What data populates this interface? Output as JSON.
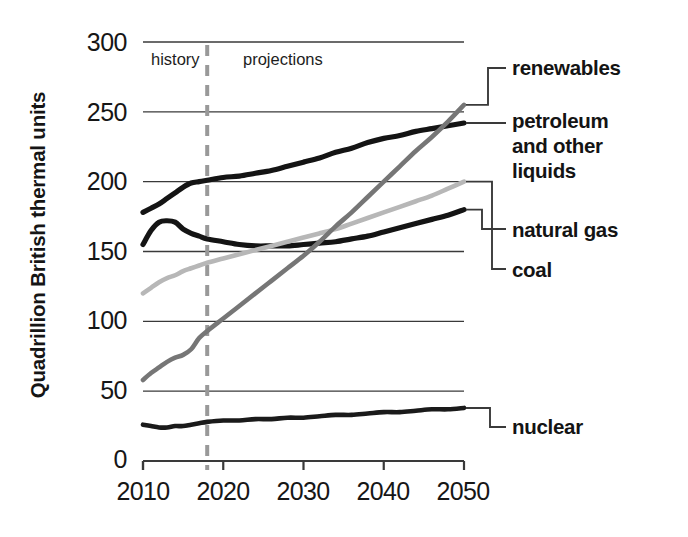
{
  "chart_data": {
    "type": "line",
    "title": "",
    "xlabel": "",
    "ylabel": "Quadrillion British thermal units",
    "xlim": [
      2010,
      2050
    ],
    "ylim": [
      0,
      300
    ],
    "ytick_labels": [
      "300",
      "250",
      "200",
      "150",
      "100",
      "50",
      "0"
    ],
    "ytick_values": [
      300,
      250,
      200,
      150,
      100,
      50,
      0
    ],
    "xtick_labels": [
      "2010",
      "2020",
      "2030",
      "2040",
      "2050"
    ],
    "xtick_values": [
      2010,
      2020,
      2030,
      2040,
      2050
    ],
    "grid": true,
    "legend_position": "right-callouts",
    "annotations": [
      {
        "name": "history",
        "text": "history",
        "x": 2014
      },
      {
        "name": "projections",
        "text": "projections",
        "x": 2033
      },
      {
        "name": "divider",
        "text": "",
        "x": 2018,
        "style": "dashed"
      }
    ],
    "x": [
      2010,
      2011,
      2012,
      2013,
      2014,
      2015,
      2016,
      2017,
      2018,
      2020,
      2022,
      2024,
      2026,
      2028,
      2030,
      2032,
      2034,
      2036,
      2038,
      2040,
      2042,
      2044,
      2046,
      2048,
      2050
    ],
    "series": [
      {
        "name": "petroleum and other liquids",
        "color": "#141414",
        "values": [
          178,
          181,
          184,
          188,
          192,
          196,
          199,
          200,
          201,
          203,
          204,
          206,
          208,
          211,
          214,
          217,
          221,
          224,
          228,
          231,
          233,
          236,
          238,
          240,
          242
        ]
      },
      {
        "name": "natural gas",
        "color": "#141414",
        "values": [
          155,
          165,
          171,
          172,
          171,
          166,
          163,
          161,
          159,
          157,
          155,
          154,
          154,
          154,
          155,
          156,
          157,
          159,
          161,
          164,
          167,
          170,
          173,
          176,
          180
        ]
      },
      {
        "name": "coal",
        "color": "#b7b7b7",
        "values": [
          120,
          124,
          128,
          131,
          133,
          136,
          138,
          140,
          142,
          145,
          148,
          151,
          154,
          157,
          160,
          163,
          166,
          170,
          174,
          178,
          182,
          186,
          190,
          195,
          200
        ]
      },
      {
        "name": "renewables",
        "color": "#767676",
        "values": [
          58,
          63,
          67,
          71,
          74,
          76,
          80,
          88,
          93,
          102,
          111,
          120,
          129,
          138,
          147,
          157,
          168,
          178,
          189,
          200,
          211,
          222,
          232,
          243,
          255
        ]
      },
      {
        "name": "nuclear",
        "color": "#1a1a1a",
        "values": [
          26,
          25,
          24,
          24,
          25,
          25,
          26,
          27,
          28,
          29,
          29,
          30,
          30,
          31,
          31,
          32,
          33,
          33,
          34,
          35,
          35,
          36,
          37,
          37,
          38
        ]
      }
    ]
  },
  "labels": {
    "renewables": "renewables",
    "petroleum_line1": "petroleum",
    "petroleum_line2": "and other",
    "petroleum_line3": "liquids",
    "natural_gas": "natural gas",
    "coal": "coal",
    "nuclear": "nuclear"
  },
  "axis": {
    "y_title": "Quadrillion British thermal units"
  }
}
